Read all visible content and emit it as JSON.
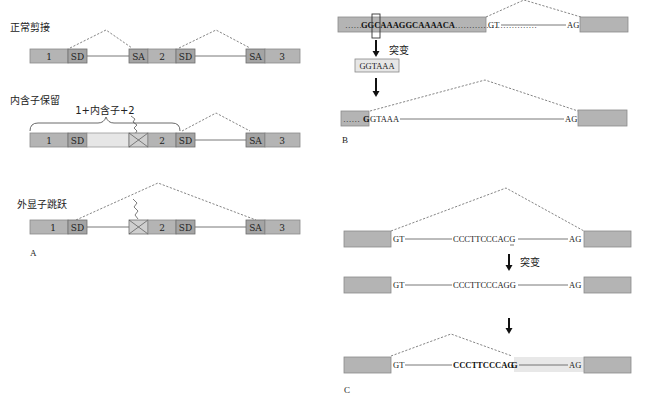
{
  "panel_a": {
    "label": "A",
    "normal_splicing": {
      "title": "正常剪接",
      "exon1": "1",
      "sd1": "SD",
      "sa2": "SA",
      "exon2": "2",
      "sd2": "SD",
      "sa3": "SA",
      "exon3": "3"
    },
    "intron_retention": {
      "title": "内含子保留",
      "brace_label": "1+内含子+2",
      "exon1": "1",
      "sd1": "SD",
      "exon2": "2",
      "sd2": "SD",
      "sa3": "SA",
      "exon3": "3"
    },
    "exon_skipping": {
      "title": "外显子跳跃",
      "exon1": "1",
      "sd1": "SD",
      "exon2": "2",
      "sd2": "SD",
      "sa3": "SA",
      "exon3": "3"
    }
  },
  "panel_b": {
    "label": "B",
    "top_dots_left": "……",
    "top_sequence": "GGCAAAGGCAAAACA",
    "top_dots_right": "…………………………",
    "gt": "GT",
    "ag": "AG",
    "mutation_label": "突变",
    "mutant_box": "GGTAAA",
    "bottom_dots": "……",
    "bottom_g": "G",
    "bottom_gtaaa": "GTAAA",
    "bottom_ag": "AG"
  },
  "panel_c": {
    "label": "C",
    "row1": {
      "gt": "GT",
      "sequence": "CCCTTCCCACG",
      "ag": "AG"
    },
    "mutation_label": "突变",
    "row2": {
      "gt": "GT",
      "sequence": "CCCTTCCCAGG",
      "ag": "AG"
    },
    "row3": {
      "gt": "GT",
      "sequence": "CCCTTCCCAG",
      "sequence_last": "G",
      "ag": "AG"
    }
  },
  "colors": {
    "exon": "#b4b4b4",
    "splice_site": "#a4a4a4",
    "retained_intron": "#e6e6e6",
    "new_exon_highlight": "#e8e8e8"
  }
}
